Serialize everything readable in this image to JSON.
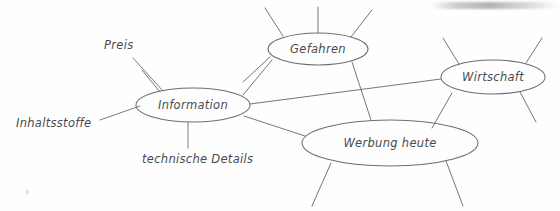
{
  "document": {
    "title": "Mindmap Information",
    "language": "de",
    "medium": "hand-drawn pencil sketch on white paper",
    "background_color": "#fefefe",
    "ink_color": "#6e6e72",
    "text_color": "#4a4a4e"
  },
  "nodes": [
    {
      "id": "information",
      "label": "Information",
      "shape": "ellipse",
      "cx": 193,
      "cy": 105,
      "rx": 57,
      "ry": 17
    },
    {
      "id": "gefahren",
      "label": "Gefahren",
      "shape": "ellipse",
      "cx": 318,
      "cy": 49,
      "rx": 50,
      "ry": 16
    },
    {
      "id": "wirtschaft",
      "label": "Wirtschaft",
      "shape": "ellipse",
      "cx": 493,
      "cy": 77,
      "rx": 52,
      "ry": 17
    },
    {
      "id": "werbung-heute",
      "label": "Werbung heute",
      "shape": "ellipse",
      "cx": 390,
      "cy": 143,
      "rx": 88,
      "ry": 23
    }
  ],
  "leaf_labels": [
    {
      "id": "preis",
      "label": "Preis",
      "x": 104,
      "y": 49,
      "anchor": "start"
    },
    {
      "id": "inhaltsstoffe",
      "label": "Inhaltsstoffe",
      "x": 16,
      "y": 127,
      "anchor": "start"
    },
    {
      "id": "technische-details",
      "label": "technische Details",
      "x": 142,
      "y": 163,
      "anchor": "start"
    }
  ],
  "edges": [
    {
      "from": "information",
      "to": "gefahren"
    },
    {
      "from": "information",
      "to": "wirtschaft"
    },
    {
      "from": "information",
      "to": "werbung-heute"
    },
    {
      "from": "gefahren",
      "to": "werbung-heute"
    },
    {
      "from": "wirtschaft",
      "to": "werbung-heute"
    }
  ],
  "leaders": [
    {
      "from": "preis",
      "to": "information"
    },
    {
      "from": "inhaltsstoffe",
      "to": "information"
    },
    {
      "from": "technische-details",
      "to": "information"
    }
  ],
  "open_spokes": {
    "gefahren": 3,
    "wirtschaft": 3,
    "werbung_heute": 2,
    "description": "short unlabeled branch stubs radiating outward from nodes"
  },
  "artifacts": {
    "scan_shadow": "gray gradient streak at top-right edge of scanned page",
    "speck": "small gray paper speck at lower-left"
  }
}
